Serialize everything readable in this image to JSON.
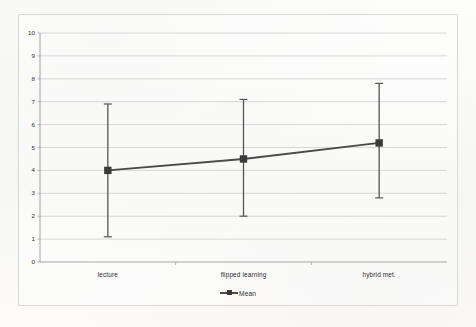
{
  "chart_data": {
    "type": "line",
    "title": "",
    "subtitle": "",
    "xlabel": "",
    "ylabel": "",
    "categories": [
      "lecture",
      "flipped learning",
      "hybrid met."
    ],
    "series": [
      {
        "name": "Mean",
        "values": [
          4.0,
          4.5,
          5.2
        ],
        "error_low": [
          1.1,
          2.0,
          2.8
        ],
        "error_high": [
          6.9,
          7.1,
          7.8
        ]
      }
    ],
    "ylim": [
      0,
      10
    ],
    "ytick_step": 1,
    "yticks": [
      "10",
      "9",
      "8",
      "7",
      "6",
      "5",
      "4",
      "3",
      "2",
      "1",
      "0"
    ],
    "grid": "horizontal",
    "legend_position": "bottom",
    "legend_entries": [
      "Mean"
    ],
    "error_bars": true,
    "marker": "square",
    "colors": {
      "line": "#4a4a4a",
      "marker": "#3a3a3a",
      "error_bar": "#555555",
      "grid": "#c9c9c9",
      "axis": "#9a9a9a",
      "text": "#2b2b2b",
      "frame": "#d8d8d6",
      "background": "#fbfbfa"
    }
  },
  "legend": {
    "mean_label": "Mean"
  }
}
